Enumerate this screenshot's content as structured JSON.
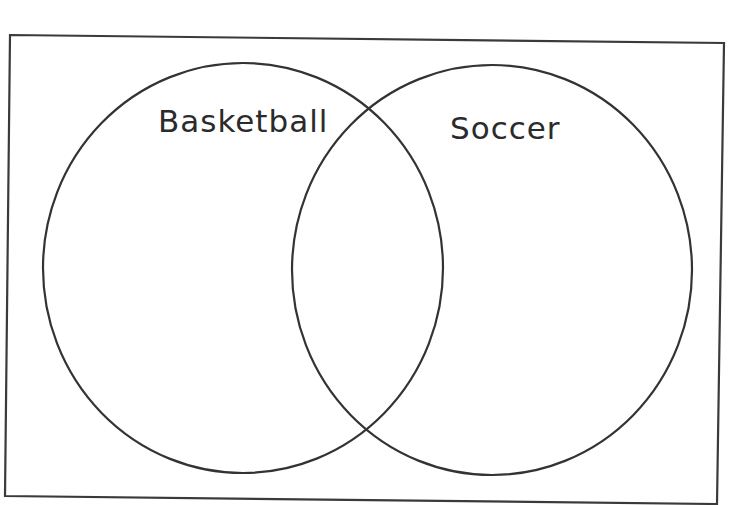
{
  "diagram": {
    "type": "venn",
    "sets": [
      {
        "id": "basketball",
        "label": "Basketball"
      },
      {
        "id": "soccer",
        "label": "Soccer"
      }
    ],
    "stroke_color": "#333333",
    "background": "#ffffff"
  }
}
